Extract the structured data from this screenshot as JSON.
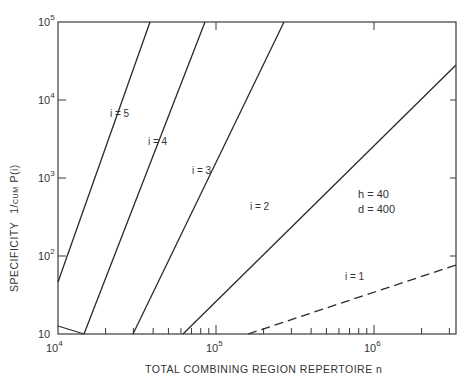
{
  "chart_data": {
    "type": "line",
    "title": "",
    "xlabel": "TOTAL COMBINING REGION REPERTOIRE n",
    "ylabel": "SPECIFICITY 1/CUM P(i)",
    "ylabel_parts": {
      "main": "SPECIFICITY",
      "frac": "1/",
      "sub": "CUM",
      "tail": "P(i)"
    },
    "xscale": "log",
    "yscale": "log",
    "xlim": [
      10000,
      3300000
    ],
    "ylim": [
      10,
      100000
    ],
    "grid": false,
    "x_ticks": [
      {
        "base": "10",
        "exp": "4",
        "value": 10000
      },
      {
        "base": "10",
        "exp": "5",
        "value": 100000
      },
      {
        "base": "10",
        "exp": "6",
        "value": 1000000
      }
    ],
    "y_ticks": [
      {
        "base": "10",
        "exp": "",
        "value": 10
      },
      {
        "base": "10",
        "exp": "2",
        "value": 100
      },
      {
        "base": "10",
        "exp": "3",
        "value": 1000
      },
      {
        "base": "10",
        "exp": "4",
        "value": 10000
      },
      {
        "base": "10",
        "exp": "5",
        "value": 100000
      }
    ],
    "annotations": {
      "h": "h = 40",
      "d": "d = 400"
    },
    "series": [
      {
        "name": "i=5",
        "label": "i = 5",
        "style": "solid",
        "points": [
          [
            10000,
            46
          ],
          [
            38000,
            100000
          ]
        ]
      },
      {
        "name": "i=4",
        "label": "i = 4",
        "style": "solid",
        "points": [
          [
            10000,
            13
          ],
          [
            15000,
            10
          ],
          [
            60000,
            100000
          ]
        ]
      },
      {
        "name": "i=3",
        "label": "i = 3",
        "style": "solid",
        "points": [
          [
            14500,
            10
          ],
          [
            130000,
            100000
          ]
        ]
      },
      {
        "name": "i=2",
        "label": "i = 2",
        "style": "solid",
        "points": [
          [
            29000,
            10
          ],
          [
            3300000,
            56000
          ]
        ]
      },
      {
        "name": "i=1",
        "label": "i = 1",
        "style": "dashed",
        "points": [
          [
            165000,
            10
          ],
          [
            3300000,
            170
          ]
        ]
      }
    ]
  }
}
